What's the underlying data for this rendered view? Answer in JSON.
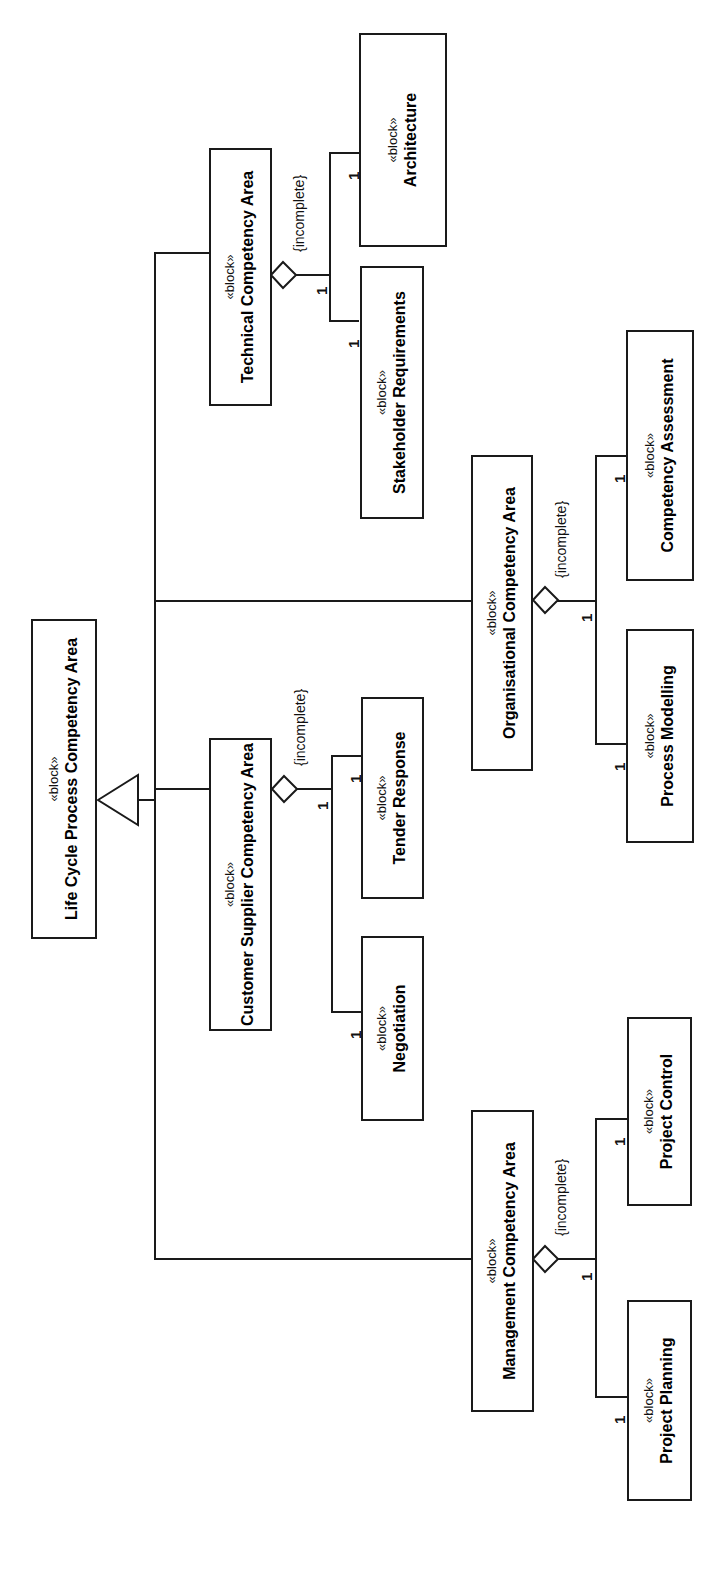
{
  "diagram": {
    "kind": "SysML Block Definition Diagram",
    "stereotype": "«block»",
    "constraint_label": "{incomplete}",
    "multiplicity": "1",
    "line_color": "#1a1a1a",
    "background_color": "#ffffff"
  },
  "blocks": {
    "root": {
      "stereotype": "«block»",
      "name": "Life Cycle Process Competency Area"
    },
    "technical": {
      "stereotype": "«block»",
      "name": "Technical Competency Area"
    },
    "architecture": {
      "stereotype": "«block»",
      "name": "Architecture"
    },
    "stakeholder_requirements": {
      "stereotype": "«block»",
      "name": "Stakeholder Requirements"
    },
    "organisational": {
      "stereotype": "«block»",
      "name": "Organisational Competency Area"
    },
    "competency_assessment": {
      "stereotype": "«block»",
      "name": "Competency Assessment"
    },
    "process_modelling": {
      "stereotype": "«block»",
      "name": "Process Modelling"
    },
    "customer_supplier": {
      "stereotype": "«block»",
      "name": "Customer Supplier Competency Area"
    },
    "tender_response": {
      "stereotype": "«block»",
      "name": "Tender Response"
    },
    "negotiation": {
      "stereotype": "«block»",
      "name": "Negotiation"
    },
    "management": {
      "stereotype": "«block»",
      "name": "Management Competency Area"
    },
    "project_control": {
      "stereotype": "«block»",
      "name": "Project Control"
    },
    "project_planning": {
      "stereotype": "«block»",
      "name": "Project Planning"
    }
  },
  "labels": {
    "incomplete_technical": "{incomplete}",
    "incomplete_organisational": "{incomplete}",
    "incomplete_customer_supplier": "{incomplete}",
    "incomplete_management": "{incomplete}",
    "mult_tech_diamond": "1",
    "mult_architecture": "1",
    "mult_stakeholder": "1",
    "mult_org_diamond": "1",
    "mult_assessment": "1",
    "mult_process": "1",
    "mult_cs_diamond": "1",
    "mult_tender": "1",
    "mult_negotiation": "1",
    "mult_mgmt_diamond": "1",
    "mult_control": "1",
    "mult_planning": "1"
  }
}
